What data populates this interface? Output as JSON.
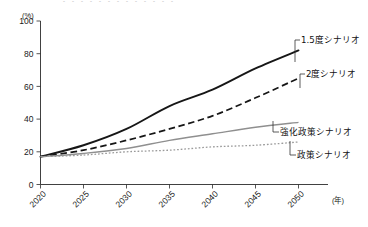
{
  "top_cut_text": "・・・・・・・・・・・・・",
  "axes": {
    "y_unit": "(%)",
    "x_unit": "(年)",
    "y_ticks": [
      "0",
      "20",
      "40",
      "60",
      "80",
      "100"
    ],
    "x_ticks": [
      "2020",
      "2025",
      "2030",
      "2035",
      "2040",
      "2045",
      "2050"
    ]
  },
  "annotations": {
    "s15": "1.5度シナリオ",
    "s2": "2度シナリオ",
    "enh": "強化政策シナリオ",
    "pol": "政策シナリオ"
  },
  "colors": {
    "black": "#161616",
    "gray": "#8f8f8f",
    "axis": "#2b2b2b"
  },
  "chart_data": {
    "type": "line",
    "title": "",
    "xlabel": "(年)",
    "ylabel": "(%)",
    "xlim": [
      2020,
      2050
    ],
    "ylim": [
      0,
      100
    ],
    "grid": false,
    "legend_position": "inline-right-labels",
    "x": [
      2020,
      2025,
      2030,
      2035,
      2040,
      2045,
      2050
    ],
    "series": [
      {
        "name": "1.5度シナリオ",
        "style": "solid",
        "color": "#161616",
        "values": [
          17,
          24,
          34,
          48,
          58,
          71,
          82
        ]
      },
      {
        "name": "2度シナリオ",
        "style": "dashed",
        "color": "#161616",
        "values": [
          17,
          21,
          27,
          34,
          42,
          53,
          65
        ]
      },
      {
        "name": "強化政策シナリオ",
        "style": "solid",
        "color": "#8f8f8f",
        "values": [
          17,
          19,
          22,
          27,
          31,
          35,
          38
        ]
      },
      {
        "name": "政策シナリオ",
        "style": "dotted",
        "color": "#9a9a9a",
        "values": [
          17,
          18,
          20,
          21,
          23,
          24,
          26
        ]
      }
    ]
  }
}
